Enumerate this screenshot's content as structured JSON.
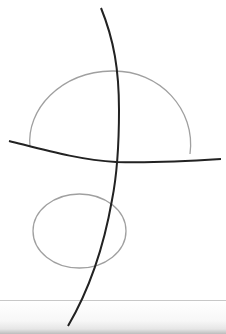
{
  "diagram": {
    "colors": {
      "background": "#ffffff",
      "dark_stroke": "#222222",
      "gray_stroke": "#a0a0a0",
      "band_line": "#c8c8c8"
    },
    "shapes": [
      {
        "name": "vertical-curve",
        "type": "curve",
        "color": "dark"
      },
      {
        "name": "horizontal-curve",
        "type": "curve",
        "color": "dark"
      },
      {
        "name": "upper-dome",
        "type": "semi-ellipse",
        "color": "gray"
      },
      {
        "name": "lower-ellipse",
        "type": "ellipse",
        "color": "gray"
      }
    ]
  }
}
